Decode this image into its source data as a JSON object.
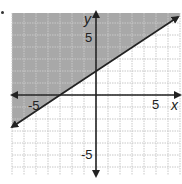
{
  "chart_data": {
    "type": "line",
    "title": "",
    "xlabel": "x",
    "ylabel": "y",
    "xlim": [
      -7,
      7
    ],
    "ylim": [
      -7,
      7
    ],
    "grid": true,
    "tick_labels": {
      "x": [
        "-5",
        "5"
      ],
      "y": [
        "5",
        "-5"
      ]
    },
    "series": [
      {
        "name": "boundary line",
        "style": "solid",
        "slope": 0.6667,
        "y_intercept": 2,
        "x_intercept": -3,
        "points": [
          [
            -3,
            0
          ],
          [
            0,
            2
          ],
          [
            3,
            4
          ]
        ]
      }
    ],
    "shaded_region": "above line",
    "inequality": "y >= (2/3)x + 2"
  },
  "labels": {
    "x_axis": "x",
    "y_axis": "y",
    "x_neg": "-5",
    "x_pos": "5",
    "y_pos": "5",
    "y_neg": "-5"
  },
  "colors": {
    "shade": "#a8a8a8",
    "grid": "#c8c8c8",
    "axis": "#222222"
  }
}
